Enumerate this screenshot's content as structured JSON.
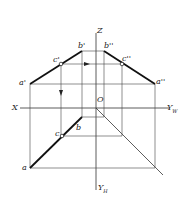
{
  "diagram": {
    "type": "orthographic-projection",
    "axes": {
      "z": "Z",
      "x": "X",
      "yw": "Y",
      "yw_sub": "W",
      "yh": "Y",
      "yh_sub": "H",
      "origin": "O"
    },
    "points": {
      "a_front": "a'",
      "b_front": "b'",
      "c_front": "c'",
      "a_side": "a''",
      "b_side": "b''",
      "c_side": "c''",
      "a_top": "a",
      "b_top": "b",
      "c_top": "c"
    },
    "colors": {
      "line": "#333333",
      "thick": "#111111"
    }
  }
}
